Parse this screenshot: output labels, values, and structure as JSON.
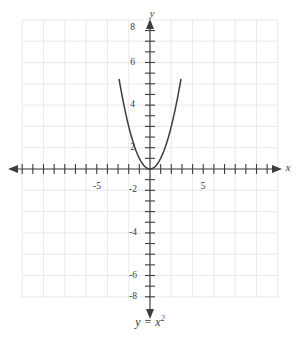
{
  "figure": {
    "caption": "y = x",
    "caption_exponent": "2",
    "background_color": "#ffffff",
    "grid_color": "#dfe3ea",
    "axis_color": "#3d3d3d",
    "curve_color": "#3d3d3d",
    "label_color": "#3a3a3a"
  },
  "axes": {
    "x_axis_label": "x",
    "y_axis_label": "y",
    "x_tick_labels": [
      "-5",
      "5"
    ],
    "y_tick_labels": [
      "8",
      "6",
      "4",
      "2",
      "-2",
      "-4",
      "-6",
      "-8"
    ]
  },
  "chart_data": {
    "type": "line",
    "title": "",
    "subtitle": "",
    "xlabel": "x",
    "ylabel": "y",
    "equation": "y = x^2",
    "xlim": [
      -7,
      7
    ],
    "ylim": [
      -9,
      9
    ],
    "xticks": [
      -7,
      -6,
      -5,
      -4,
      -3,
      -2,
      -1,
      0,
      1,
      2,
      3,
      4,
      5,
      6,
      7
    ],
    "yticks": [
      -9,
      -8,
      -7,
      -6,
      -5,
      -4,
      -3,
      -2,
      -1,
      0,
      1,
      2,
      3,
      4,
      5,
      6,
      7,
      8,
      9
    ],
    "xtick_labels_shown": {
      "-5": "-5",
      "5": "5"
    },
    "ytick_labels_shown": {
      "8": "8",
      "6": "6",
      "4": "4",
      "2": "2",
      "-2": "-2",
      "-4": "-4",
      "-6": "-6",
      "-8": "-8"
    },
    "grid": true,
    "grid_spacing_units": 2,
    "legend": null,
    "series": [
      {
        "name": "y = x^2",
        "x": [
          -2.9,
          -2.8,
          -2.7,
          -2.6,
          -2.5,
          -2.4,
          -2.3,
          -2.2,
          -2.1,
          -2.0,
          -1.9,
          -1.8,
          -1.7,
          -1.6,
          -1.5,
          -1.4,
          -1.3,
          -1.2,
          -1.1,
          -1.0,
          -0.9,
          -0.8,
          -0.7,
          -0.6,
          -0.5,
          -0.4,
          -0.3,
          -0.2,
          -0.1,
          0.0,
          0.1,
          0.2,
          0.3,
          0.4,
          0.5,
          0.6,
          0.7,
          0.8,
          0.9,
          1.0,
          1.1,
          1.2,
          1.3,
          1.4,
          1.5,
          1.6,
          1.7,
          1.8,
          1.9,
          2.0,
          2.1,
          2.2,
          2.3,
          2.4,
          2.5,
          2.6,
          2.7,
          2.8,
          2.9
        ],
        "y": [
          8.41,
          7.84,
          7.29,
          6.76,
          6.25,
          5.76,
          5.29,
          4.84,
          4.41,
          4.0,
          3.61,
          3.24,
          2.89,
          2.56,
          2.25,
          1.96,
          1.69,
          1.44,
          1.21,
          1.0,
          0.81,
          0.64,
          0.49,
          0.36,
          0.25,
          0.16,
          0.09,
          0.04,
          0.01,
          0.0,
          0.01,
          0.04,
          0.09,
          0.16,
          0.25,
          0.36,
          0.49,
          0.64,
          0.81,
          1.0,
          1.21,
          1.44,
          1.69,
          1.96,
          2.25,
          2.56,
          2.89,
          3.24,
          3.61,
          4.0,
          4.41,
          4.84,
          5.29,
          5.76,
          6.25,
          6.76,
          7.29,
          7.84,
          8.41
        ]
      }
    ],
    "annotations": [
      {
        "text": "y = x^2",
        "position": "below-axes-center"
      }
    ]
  }
}
